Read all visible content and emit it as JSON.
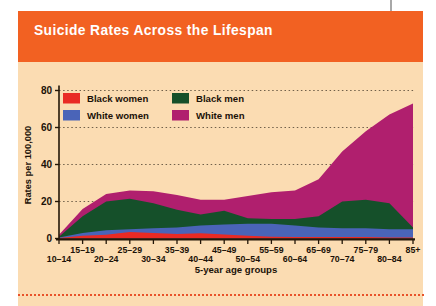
{
  "header": {
    "title": "Suicide Rates Across the Lifespan"
  },
  "colors": {
    "header_bg": "#f26122",
    "title_text": "#ffffff",
    "panel_bg": "#fbdcb2",
    "axis": "#241708",
    "text": "#1c1208",
    "grid": "#70604a",
    "bottom_border": "#e8522a",
    "crease_line": "#a8a8a8",
    "black_women": "#e92a24",
    "white_women": "#4a64b8",
    "black_men": "#15502a",
    "white_men": "#b01f6e"
  },
  "chart_data": {
    "type": "area",
    "title": "Suicide Rates Across the Lifespan",
    "xlabel": "5-year age groups",
    "ylabel": "Rates per 100,000",
    "ylim": [
      0,
      80
    ],
    "yticks": [
      0,
      20,
      40,
      60,
      80
    ],
    "grid": "horizontal dotted",
    "legend_position": "top-left inside plot",
    "categories": [
      "10–14",
      "15–19",
      "20–24",
      "25–29",
      "30–34",
      "35–39",
      "40–44",
      "45–49",
      "50–54",
      "55–59",
      "60–64",
      "65–69",
      "70–74",
      "75–79",
      "80–84",
      "85+"
    ],
    "series": [
      {
        "name": "Black women",
        "color_key": "black_women",
        "values": [
          0.3,
          1.5,
          2,
          3.5,
          3,
          2.5,
          2.8,
          2.2,
          1.5,
          1,
          0.8,
          0.8,
          0.8,
          0.8,
          0.5,
          0.5
        ]
      },
      {
        "name": "White women",
        "color_key": "white_women",
        "values": [
          0.5,
          3,
          4.5,
          5,
          5.5,
          6,
          7,
          7.5,
          8,
          8,
          7,
          6,
          5.5,
          5.5,
          5,
          5
        ]
      },
      {
        "name": "Black men",
        "color_key": "black_men",
        "values": [
          1,
          12,
          20,
          21.5,
          19,
          15.5,
          13,
          15,
          11,
          10.5,
          10.5,
          12,
          20,
          21,
          19,
          6
        ]
      },
      {
        "name": "White men",
        "color_key": "white_men",
        "values": [
          2,
          16,
          24,
          26,
          25.5,
          23.5,
          21,
          21,
          23,
          25,
          26,
          32,
          47,
          58,
          67,
          73
        ]
      }
    ],
    "draw_order_back_to_front": [
      "White men",
      "Black men",
      "White women",
      "Black women"
    ],
    "legend_rows": [
      [
        "Black women",
        "Black men"
      ],
      [
        "White women",
        "White men"
      ]
    ]
  }
}
